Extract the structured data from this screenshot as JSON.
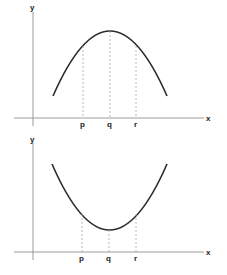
{
  "graphs": [
    {
      "name": "maximum-parabola",
      "axis_labels": {
        "x": "x",
        "y": "y"
      },
      "points": {
        "p": "p",
        "q": "q",
        "r": "r"
      },
      "shape": "concave-down",
      "colors": {
        "curve": "#2b2b2b",
        "axes": "#9a9a9a",
        "guides": "#a8a8a8"
      }
    },
    {
      "name": "minimum-parabola",
      "axis_labels": {
        "x": "x",
        "y": "y"
      },
      "points": {
        "p": "p",
        "q": "q",
        "r": "r"
      },
      "shape": "concave-up",
      "colors": {
        "curve": "#2b2b2b",
        "axes": "#9a9a9a",
        "guides": "#a8a8a8"
      }
    }
  ]
}
